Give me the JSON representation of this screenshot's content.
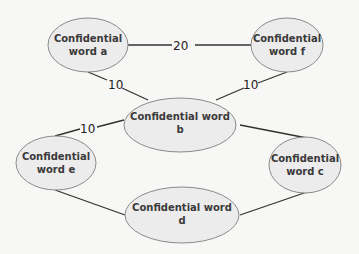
{
  "diagram": {
    "type": "weighted-graph",
    "nodes": [
      {
        "id": "a",
        "line1": "Confidential",
        "line2": "word a"
      },
      {
        "id": "b",
        "line1": "Confidential word",
        "line2": "b"
      },
      {
        "id": "c",
        "line1": "Confidential",
        "line2": "word c"
      },
      {
        "id": "d",
        "line1": "Confidential word",
        "line2": "d"
      },
      {
        "id": "e",
        "line1": "Confidential",
        "line2": "word e"
      },
      {
        "id": "f",
        "line1": "Confidential",
        "line2": "word f"
      }
    ],
    "edges": [
      {
        "from": "a",
        "to": "f",
        "weight": "20"
      },
      {
        "from": "a",
        "to": "b",
        "weight": "10"
      },
      {
        "from": "f",
        "to": "b",
        "weight": "10"
      },
      {
        "from": "e",
        "to": "b",
        "weight": "10"
      },
      {
        "from": "b",
        "to": "c",
        "weight": ""
      },
      {
        "from": "e",
        "to": "d",
        "weight": ""
      },
      {
        "from": "d",
        "to": "c",
        "weight": ""
      }
    ]
  }
}
